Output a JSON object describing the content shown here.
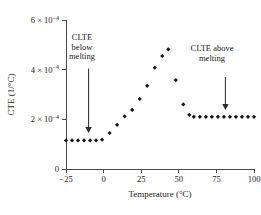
{
  "chart_data": {
    "type": "scatter",
    "title": "",
    "xlabel": "Temperature (°C)",
    "ylabel": "CTE (1/°C)",
    "xlim": [
      -25,
      100
    ],
    "ylim": [
      0,
      0.0006
    ],
    "xticks": [
      -25,
      0,
      25,
      50,
      75,
      100
    ],
    "xtick_labels": [
      "−25",
      "0",
      "25",
      "50",
      "75",
      "100"
    ],
    "yticks": [
      0,
      0.0002,
      0.0004,
      0.0006
    ],
    "ytick_labels": [
      "0",
      "2 × 10",
      "4 × 10",
      "6 × 10"
    ],
    "ytick_exponent": "−4",
    "grid": false,
    "legend": null,
    "marker": "diamond",
    "marker_color": "#141414",
    "axis_color": "#4a4a4a",
    "series": [
      {
        "name": "CLTE below melting",
        "x": [
          -25,
          -21,
          -17,
          -13,
          -9,
          -5,
          -1
        ],
        "y": [
          0.000115,
          0.000115,
          0.000115,
          0.000115,
          0.000115,
          0.000115,
          0.000118
        ]
      },
      {
        "name": "melting transition ramp",
        "x": [
          4,
          9,
          14,
          19,
          24,
          29,
          34,
          39,
          43
        ],
        "y": [
          0.000145,
          0.000178,
          0.000212,
          0.000238,
          0.000282,
          0.000335,
          0.000408,
          0.000455,
          0.000482
        ]
      },
      {
        "name": "post-melt drop",
        "x": [
          48,
          53,
          57
        ],
        "y": [
          0.000358,
          0.00026,
          0.000218
        ]
      },
      {
        "name": "CLTE above melting",
        "x": [
          60,
          64,
          68,
          72,
          76,
          80,
          84,
          88,
          92,
          96,
          100
        ],
        "y": [
          0.00021,
          0.00021,
          0.00021,
          0.00021,
          0.00021,
          0.00021,
          0.00021,
          0.00021,
          0.00021,
          0.00021,
          0.00021
        ]
      }
    ],
    "annotations": [
      {
        "name": "clte-below-melting",
        "text": "CLTE\nbelow\nmelting",
        "arrow": {
          "x": -10,
          "y_from": 0.000405,
          "y_to": 0.000145,
          "direction": "down"
        }
      },
      {
        "name": "clte-above-melting",
        "text": "CLTE above\nmelting",
        "arrow": {
          "x": 81,
          "y_from": 0.00037,
          "y_to": 0.000238,
          "direction": "down"
        }
      }
    ]
  }
}
